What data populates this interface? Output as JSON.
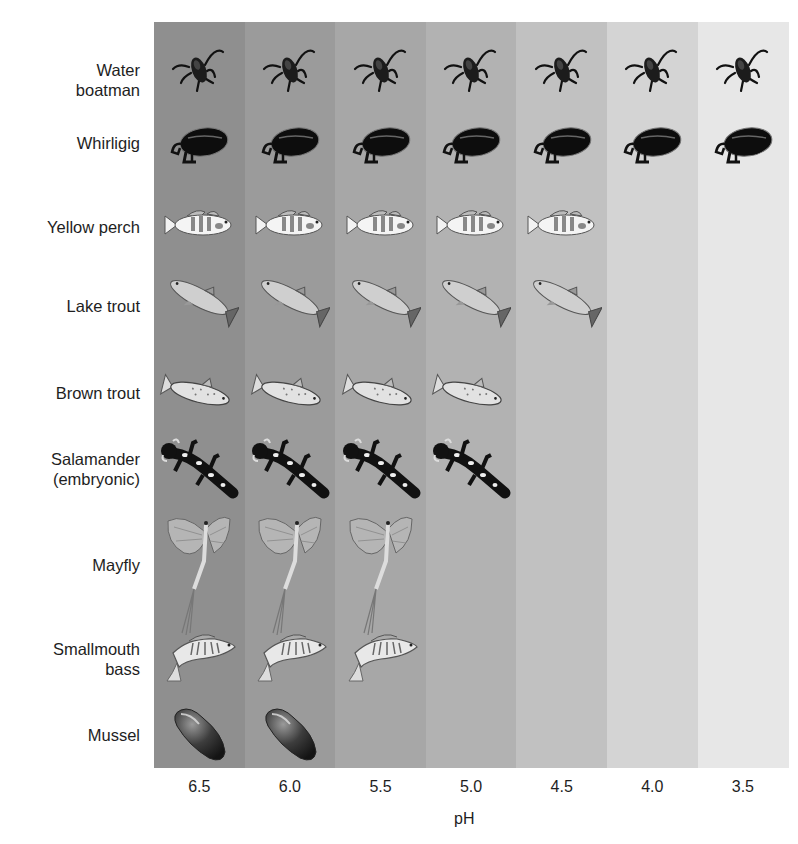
{
  "chart_data": {
    "type": "table",
    "title": "",
    "xlabel": "pH",
    "ylabel": "",
    "categories": [
      "6.5",
      "6.0",
      "5.5",
      "5.0",
      "4.5",
      "4.0",
      "3.5"
    ],
    "band_colors": [
      "#8f8f8f",
      "#9b9b9b",
      "#a7a7a7",
      "#b2b2b2",
      "#c1c1c1",
      "#d4d4d4",
      "#e7e7e7"
    ],
    "organisms": [
      {
        "name": "Water boatman",
        "label": "Water\nboatman",
        "icon": "water-boatman-icon",
        "present_at": [
          "6.5",
          "6.0",
          "5.5",
          "5.0",
          "4.5",
          "4.0",
          "3.5"
        ],
        "min_ph": 3.5
      },
      {
        "name": "Whirligig",
        "label": "Whirligig",
        "icon": "whirligig-beetle-icon",
        "present_at": [
          "6.5",
          "6.0",
          "5.5",
          "5.0",
          "4.5",
          "4.0",
          "3.5"
        ],
        "min_ph": 3.5
      },
      {
        "name": "Yellow perch",
        "label": "Yellow perch",
        "icon": "yellow-perch-icon",
        "present_at": [
          "6.5",
          "6.0",
          "5.5",
          "5.0",
          "4.5"
        ],
        "min_ph": 4.5
      },
      {
        "name": "Lake trout",
        "label": "Lake trout",
        "icon": "lake-trout-icon",
        "present_at": [
          "6.5",
          "6.0",
          "5.5",
          "5.0",
          "4.5"
        ],
        "min_ph": 4.5
      },
      {
        "name": "Brown trout",
        "label": "Brown trout",
        "icon": "brown-trout-icon",
        "present_at": [
          "6.5",
          "6.0",
          "5.5",
          "5.0"
        ],
        "min_ph": 5.0
      },
      {
        "name": "Salamander (embryonic)",
        "label": "Salamander\n(embryonic)",
        "icon": "salamander-icon",
        "present_at": [
          "6.5",
          "6.0",
          "5.5",
          "5.0"
        ],
        "min_ph": 5.0
      },
      {
        "name": "Mayfly",
        "label": "Mayfly",
        "icon": "mayfly-icon",
        "present_at": [
          "6.5",
          "6.0",
          "5.5"
        ],
        "min_ph": 5.5
      },
      {
        "name": "Smallmouth bass",
        "label": "Smallmouth\nbass",
        "icon": "smallmouth-bass-icon",
        "present_at": [
          "6.5",
          "6.0",
          "5.5"
        ],
        "min_ph": 5.5
      },
      {
        "name": "Mussel",
        "label": "Mussel",
        "icon": "mussel-icon",
        "present_at": [
          "6.5",
          "6.0"
        ],
        "min_ph": 6.0
      }
    ],
    "grid": false,
    "legend": "none"
  }
}
